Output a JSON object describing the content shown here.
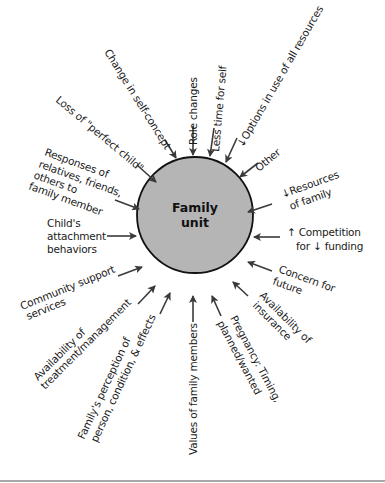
{
  "diagram": {
    "center": {
      "line1": "Family",
      "line2": "unit",
      "fill_color": "#b5b5b5",
      "stroke_color": "#111111"
    },
    "arrow_color": "#3a3a3a",
    "factors": [
      {
        "id": "change-in-self-concept",
        "lines": [
          "Change in self-concept"
        ]
      },
      {
        "id": "role-changes",
        "lines": [
          "Role changes"
        ]
      },
      {
        "id": "less-time-for-self",
        "lines": [
          "Less time for self"
        ]
      },
      {
        "id": "options-in-use",
        "lines": [
          "↓Options in use of all resources"
        ]
      },
      {
        "id": "other",
        "lines": [
          "Other"
        ]
      },
      {
        "id": "resources-of-family",
        "lines": [
          "↓Resources",
          "of family"
        ]
      },
      {
        "id": "competition-for-funding",
        "lines": [
          "↑ Competition",
          "for ↓ funding"
        ]
      },
      {
        "id": "concern-for-future",
        "lines": [
          "Concern for",
          "future"
        ]
      },
      {
        "id": "availability-of-insurance",
        "lines": [
          "Availability of",
          "insurance"
        ]
      },
      {
        "id": "pregnancy",
        "lines": [
          "Pregnancy: Timing,",
          "planned/wanted"
        ]
      },
      {
        "id": "values-of-family-members",
        "lines": [
          "Values of family members"
        ]
      },
      {
        "id": "familys-perception",
        "lines": [
          "Family's perception of",
          "person, condition, & effects"
        ]
      },
      {
        "id": "availability-of-treatment",
        "lines": [
          "Availability of",
          "treatment/management"
        ]
      },
      {
        "id": "community-support",
        "lines": [
          "Community support",
          "services"
        ]
      },
      {
        "id": "childs-attachment",
        "lines": [
          "Child's",
          "attachment",
          "behaviors"
        ]
      },
      {
        "id": "responses-of-relatives",
        "lines": [
          "Responses of",
          "relatives, friends,",
          "others to",
          "family member"
        ]
      },
      {
        "id": "loss-of-perfect-child",
        "lines": [
          "Loss of \"perfect child\""
        ]
      }
    ]
  }
}
